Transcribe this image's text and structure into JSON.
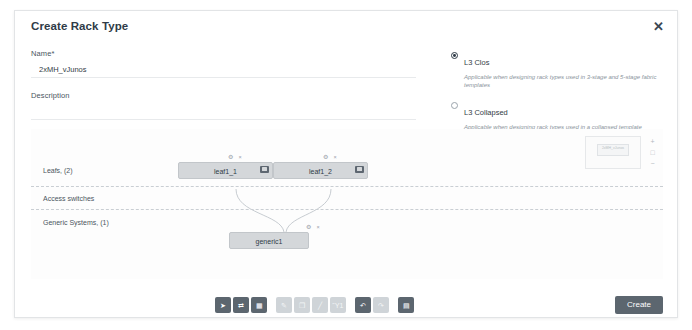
{
  "dialog": {
    "title": "Create Rack Type",
    "close_icon": "close-icon"
  },
  "form": {
    "name_label": "Name",
    "name_required_mark": "*",
    "name_value": "2xMH_vJunos",
    "name_placeholder": "",
    "description_label": "Description",
    "description_value": "",
    "description_placeholder": ""
  },
  "rack_type_options": [
    {
      "label": "L3 Clos",
      "description": "Applicable when designing rack types used in 3-stage and 5-stage fabric templates",
      "selected": true
    },
    {
      "label": "L3 Collapsed",
      "description": "Applicable when designing rack types used in a collapsed template (spineless)",
      "selected": false
    }
  ],
  "canvas": {
    "rows": [
      {
        "label": "Leafs, (2)"
      },
      {
        "label": "Access switches"
      },
      {
        "label": "Generic Systems, (1)"
      }
    ],
    "nodes": [
      {
        "label": "leaf1_1",
        "badge": "switch-icon",
        "tools": "⚙ ×"
      },
      {
        "label": "leaf1_2",
        "badge": "switch-icon",
        "tools": "⚙ ×"
      },
      {
        "label": "generic1",
        "badge": "",
        "tools": "⚙ ×"
      }
    ],
    "minimap": {
      "name": "minimap",
      "label": "2xMH_vJunos"
    },
    "zoom_controls": [
      {
        "name": "zoom-in-button",
        "glyph": "+"
      },
      {
        "name": "zoom-reset-button",
        "glyph": "□"
      },
      {
        "name": "zoom-out-button",
        "glyph": "−"
      }
    ]
  },
  "toolbar": {
    "groups": [
      {
        "name": "selection-group",
        "buttons": [
          {
            "name": "pointer-tool-button",
            "glyph": "➤",
            "enabled": true
          },
          {
            "name": "link-tool-button",
            "glyph": "⇄",
            "enabled": true
          },
          {
            "name": "grid-tool-button",
            "glyph": "▦",
            "enabled": true
          }
        ]
      },
      {
        "name": "edit-group",
        "buttons": [
          {
            "name": "edit-tool-button",
            "glyph": "✎",
            "enabled": false
          },
          {
            "name": "copy-tool-button",
            "glyph": "❐",
            "enabled": false
          },
          {
            "name": "pen-tool-button",
            "glyph": "╱",
            "enabled": false
          },
          {
            "name": "delete-tool-button",
            "glyph": "Ὕ1",
            "enabled": false
          }
        ]
      },
      {
        "name": "history-group",
        "buttons": [
          {
            "name": "undo-button",
            "glyph": "↶",
            "enabled": true
          },
          {
            "name": "redo-button",
            "glyph": "↷",
            "enabled": false
          }
        ]
      },
      {
        "name": "save-group",
        "buttons": [
          {
            "name": "save-button",
            "glyph": "▤",
            "enabled": true
          }
        ]
      }
    ]
  },
  "footer": {
    "create_label": "Create"
  },
  "colors": {
    "accent": "#5c666f",
    "node_fill": "#d4d7da",
    "text": "#333c45",
    "muted": "#8b949c"
  }
}
